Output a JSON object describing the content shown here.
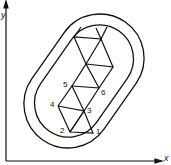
{
  "axes": {
    "x_label": "x",
    "y_label": "y"
  },
  "nodes": [
    {
      "id": "1",
      "label": "1"
    },
    {
      "id": "2",
      "label": "2"
    },
    {
      "id": "3",
      "label": "3"
    },
    {
      "id": "4",
      "label": "4"
    },
    {
      "id": "5",
      "label": "5"
    },
    {
      "id": "6",
      "label": "6"
    }
  ],
  "colors": {
    "stroke": "#111111",
    "background": "#ffffff"
  }
}
